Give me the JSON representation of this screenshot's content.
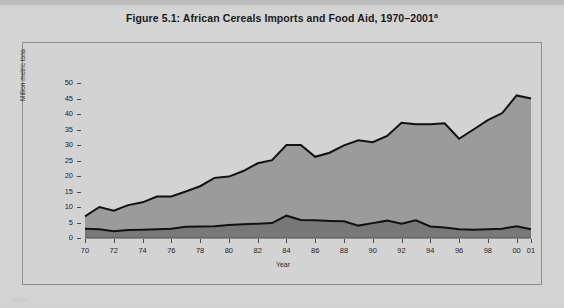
{
  "figure": {
    "title_main": "Figure 5.1:  African Cereals Imports and Food Aid, 1970–2001",
    "title_superscript": "a",
    "note_fragment": "Note:"
  },
  "chart_data": {
    "type": "area",
    "stacked": true,
    "title": "Figure 5.1:  African Cereals Imports and Food Aid, 1970–2001a",
    "xlabel": "Year",
    "ylabel": "Million metric tons",
    "ylim": [
      0,
      50
    ],
    "xlim": [
      1970,
      2001
    ],
    "grid": false,
    "legend": "none",
    "yticks": [
      0,
      5,
      10,
      15,
      20,
      25,
      30,
      35,
      40,
      45,
      50
    ],
    "ytick_labels": [
      "0",
      "5",
      "10",
      "15",
      "20",
      "25",
      "30",
      "35",
      "40",
      "45",
      "50"
    ],
    "xticks": [
      1970,
      1972,
      1974,
      1976,
      1978,
      1980,
      1982,
      1984,
      1986,
      1988,
      1990,
      1992,
      1994,
      1996,
      1998,
      2000,
      2001
    ],
    "xtick_labels": [
      "70",
      "72",
      "74",
      "76",
      "78",
      "80",
      "82",
      "84",
      "86",
      "88",
      "90",
      "92",
      "94",
      "96",
      "98",
      "00",
      "01"
    ],
    "x": [
      1970,
      1971,
      1972,
      1973,
      1974,
      1975,
      1976,
      1977,
      1978,
      1979,
      1980,
      1981,
      1982,
      1983,
      1984,
      1985,
      1986,
      1987,
      1988,
      1989,
      1990,
      1991,
      1992,
      1993,
      1994,
      1995,
      1996,
      1997,
      1998,
      1999,
      2000,
      2001
    ],
    "series": [
      {
        "name": "Food aid",
        "color": "#787878",
        "values": [
          3.0,
          2.8,
          2.2,
          2.6,
          2.7,
          2.8,
          3.0,
          3.6,
          3.7,
          3.8,
          4.2,
          4.4,
          4.6,
          4.8,
          7.2,
          5.8,
          5.7,
          5.5,
          5.4,
          4.0,
          4.8,
          5.6,
          4.6,
          5.7,
          3.7,
          3.4,
          2.8,
          2.7,
          2.8,
          3.0,
          3.8,
          2.8
        ]
      },
      {
        "name": "Commercial imports",
        "color": "#9b9b9b",
        "values": [
          4.0,
          7.2,
          6.6,
          8.0,
          8.8,
          10.6,
          10.4,
          11.4,
          13.0,
          15.6,
          15.6,
          17.2,
          19.5,
          20.3,
          22.8,
          24.2,
          20.5,
          22.0,
          24.5,
          27.5,
          26.1,
          27.3,
          32.6,
          31.0,
          33.0,
          33.6,
          29.2,
          32.3,
          35.2,
          37.3,
          42.2,
          42.2
        ]
      }
    ],
    "totals": [
      7.0,
      10.0,
      8.8,
      10.6,
      11.5,
      13.4,
      13.4,
      15.0,
      16.7,
      19.4,
      19.8,
      21.6,
      24.1,
      25.1,
      30.0,
      30.0,
      26.2,
      27.5,
      29.9,
      31.5,
      30.9,
      32.9,
      37.2,
      36.7,
      36.7,
      37.0,
      32.0,
      35.0,
      38.0,
      40.3,
      46.0,
      45.0
    ]
  },
  "colors": {
    "page_background": "#d3d3d3",
    "frame_border": "#8e8e8e",
    "line": "#111111",
    "upper_area": "#9b9b9b",
    "lower_area": "#787878",
    "text": "#1a1a1a"
  }
}
